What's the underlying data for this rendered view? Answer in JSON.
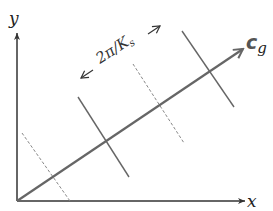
{
  "diagram": {
    "axes": {
      "x_label": "x",
      "y_label": "y"
    },
    "group_velocity": {
      "label_main": "c",
      "label_sub": "g"
    },
    "wavelength": {
      "label": "2π/K",
      "label_sub": "s"
    },
    "crests": [
      {
        "style": "dashed",
        "name": "trough-1"
      },
      {
        "style": "solid",
        "name": "crest-1"
      },
      {
        "style": "dashed",
        "name": "trough-2"
      },
      {
        "style": "solid",
        "name": "crest-2"
      }
    ],
    "colors": {
      "axis": "#333333",
      "line": "#666666",
      "dashed": "#888888"
    }
  }
}
